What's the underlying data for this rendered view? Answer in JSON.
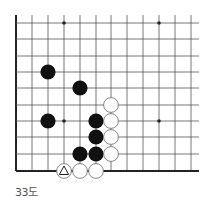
{
  "caption": "33도",
  "board": {
    "columns_x": [
      16,
      32,
      48,
      64,
      80,
      96,
      111,
      127,
      143,
      159,
      175,
      191
    ],
    "rows_y": [
      23,
      39,
      56,
      72,
      88,
      105,
      121,
      137,
      154,
      171
    ],
    "left_edge": true,
    "bottom_edge": true,
    "star_points": [
      [
        3,
        0
      ],
      [
        9,
        0
      ],
      [
        3,
        6
      ],
      [
        9,
        6
      ]
    ],
    "stones": [
      {
        "color": "black",
        "col": 2,
        "row": 3
      },
      {
        "color": "black",
        "col": 4,
        "row": 4
      },
      {
        "color": "black",
        "col": 2,
        "row": 6
      },
      {
        "color": "black",
        "col": 5,
        "row": 6
      },
      {
        "color": "black",
        "col": 5,
        "row": 7
      },
      {
        "color": "black",
        "col": 4,
        "row": 8
      },
      {
        "color": "black",
        "col": 5,
        "row": 8
      },
      {
        "color": "white",
        "col": 6,
        "row": 5
      },
      {
        "color": "white",
        "col": 6,
        "row": 6
      },
      {
        "color": "white",
        "col": 6,
        "row": 7
      },
      {
        "color": "white",
        "col": 6,
        "row": 8
      },
      {
        "color": "white",
        "col": 3,
        "row": 9,
        "marker": "triangle"
      },
      {
        "color": "white",
        "col": 4,
        "row": 9
      },
      {
        "color": "white",
        "col": 5,
        "row": 9
      }
    ],
    "colors": {
      "line": "#555555",
      "edge": "#222222",
      "black_stone": "#111111",
      "white_stone": "#ffffff",
      "stone_outline": "#666666"
    }
  }
}
